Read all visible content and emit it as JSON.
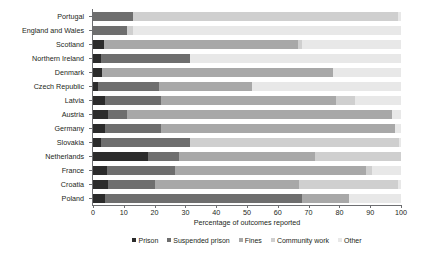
{
  "chart_data": {
    "type": "bar",
    "orientation": "horizontal",
    "stacked": true,
    "normalized": true,
    "title": "",
    "xlabel": "Percentage of outcomes reported",
    "ylabel": "",
    "xlim": [
      0,
      100
    ],
    "xticks": [
      0,
      10,
      20,
      30,
      40,
      50,
      60,
      70,
      80,
      90,
      100
    ],
    "grid": false,
    "legend_position": "bottom",
    "categories": [
      "Portugal",
      "England and Wales",
      "Scotland",
      "Northern Ireland",
      "Denmark",
      "Czech Republic",
      "Latvia",
      "Austria",
      "Germany",
      "Slovakia",
      "Netherlands",
      "France",
      "Croatia",
      "Poland"
    ],
    "series": [
      {
        "name": "Prison",
        "color": "#2b2b2b",
        "values": [
          0,
          0,
          3.5,
          2.5,
          3,
          1.5,
          4,
          5,
          4,
          2.5,
          18,
          4.5,
          5,
          4
        ]
      },
      {
        "name": "Suspended prison",
        "color": "#6e6e6e",
        "values": [
          13,
          11,
          0,
          29,
          0,
          20,
          18,
          6,
          18,
          29,
          10,
          22,
          15,
          64
        ]
      },
      {
        "name": "Fines",
        "color": "#a8a8a8",
        "values": [
          0,
          0,
          63,
          0,
          75,
          30,
          57,
          86,
          76,
          0,
          44,
          62,
          47,
          15
        ]
      },
      {
        "name": "Community work",
        "color": "#cfcfcf",
        "values": [
          86,
          2,
          1.5,
          0,
          0,
          0,
          6,
          0,
          0,
          68,
          28,
          2,
          32,
          0
        ]
      },
      {
        "name": "Other",
        "color": "#e8e8e8",
        "values": [
          1,
          87,
          32,
          68.5,
          22,
          48.5,
          15,
          3,
          2,
          0.5,
          0,
          9.5,
          1,
          17
        ]
      }
    ]
  },
  "legend": {
    "items": [
      {
        "label": "Prison",
        "color": "#2b2b2b"
      },
      {
        "label": "Suspended prison",
        "color": "#6e6e6e"
      },
      {
        "label": "Fines",
        "color": "#a8a8a8"
      },
      {
        "label": "Community work",
        "color": "#cfcfcf"
      },
      {
        "label": "Other",
        "color": "#e8e8e8"
      }
    ]
  }
}
